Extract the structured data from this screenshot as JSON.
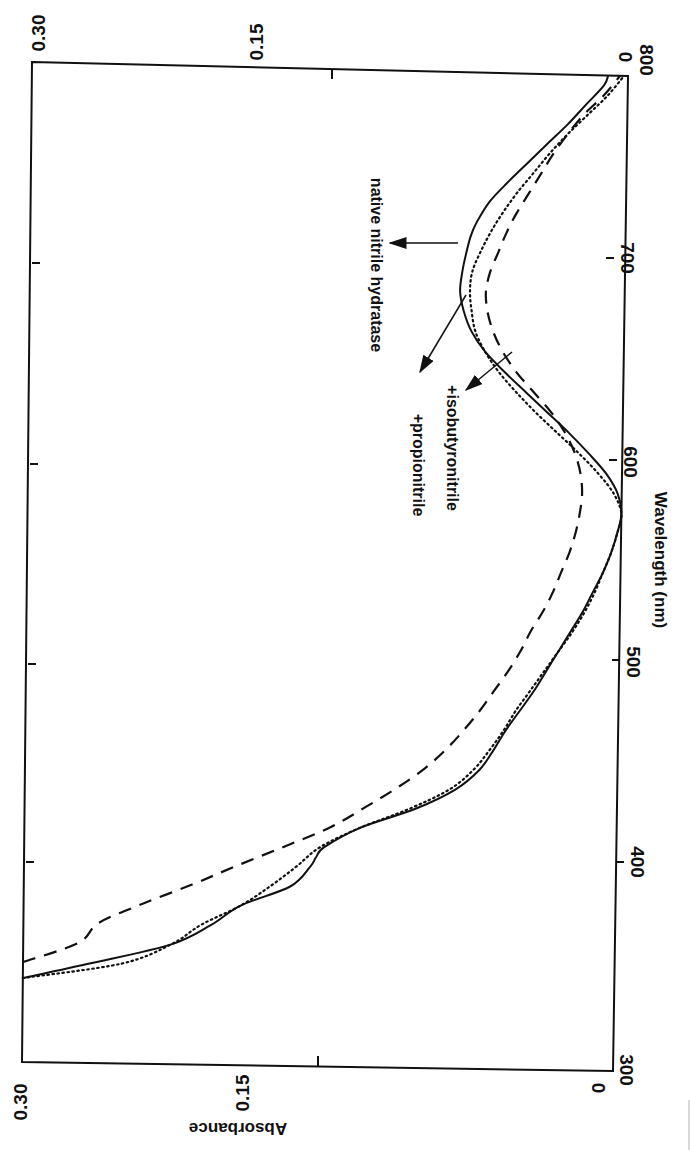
{
  "chart_data": {
    "type": "line",
    "title": "",
    "orientation": "rotated 90° clockwise (wavelength axis runs vertically on right, absorbance horizontally)",
    "xlabel": "Wavelength (nm)",
    "ylabel": "Absorbance",
    "xlim": [
      300,
      800
    ],
    "ylim": [
      0,
      0.3
    ],
    "x_ticks": [
      "300",
      "400",
      "500",
      "600",
      "700",
      "800"
    ],
    "y_ticks_bottom": [
      "0.30",
      "0.15",
      "0"
    ],
    "y_ticks_top": [
      "0.30",
      "0.15",
      "0"
    ],
    "grid": false,
    "legend": "inline annotations with arrows",
    "series": [
      {
        "name": "native nitrile hydratase",
        "style": "solid",
        "x": [
          342,
          350,
          360,
          370,
          380,
          390,
          400,
          405,
          410,
          420,
          430,
          440,
          450,
          460,
          470,
          480,
          490,
          500,
          510,
          520,
          530,
          540,
          550,
          560,
          570,
          580,
          590,
          600,
          610,
          620,
          630,
          640,
          650,
          660,
          670,
          680,
          690,
          700,
          710,
          718,
          725,
          735,
          745,
          755,
          765,
          775,
          785,
          795,
          800
        ],
        "values": [
          0.3,
          0.265,
          0.225,
          0.205,
          0.19,
          0.165,
          0.155,
          0.152,
          0.148,
          0.13,
          0.102,
          0.082,
          0.07,
          0.063,
          0.057,
          0.05,
          0.043,
          0.037,
          0.031,
          0.025,
          0.019,
          0.014,
          0.009,
          0.005,
          0.002,
          0.0,
          0.002,
          0.008,
          0.017,
          0.027,
          0.038,
          0.049,
          0.06,
          0.07,
          0.077,
          0.081,
          0.083,
          0.082,
          0.08,
          0.078,
          0.075,
          0.069,
          0.06,
          0.05,
          0.04,
          0.03,
          0.021,
          0.012,
          0.01
        ]
      },
      {
        "name": "+propionitrile",
        "style": "dotted",
        "x": [
          342,
          350,
          360,
          370,
          380,
          390,
          400,
          410,
          420,
          430,
          440,
          450,
          460,
          470,
          480,
          490,
          500,
          510,
          520,
          530,
          540,
          550,
          560,
          570,
          580,
          590,
          600,
          610,
          620,
          630,
          640,
          650,
          660,
          670,
          680,
          690,
          700,
          710,
          720,
          730,
          740,
          750,
          760,
          770,
          780,
          790,
          800
        ],
        "values": [
          0.3,
          0.25,
          0.225,
          0.21,
          0.19,
          0.175,
          0.162,
          0.15,
          0.13,
          0.105,
          0.085,
          0.073,
          0.065,
          0.058,
          0.052,
          0.045,
          0.038,
          0.031,
          0.024,
          0.018,
          0.013,
          0.009,
          0.005,
          0.002,
          0.0,
          0.004,
          0.012,
          0.022,
          0.033,
          0.044,
          0.054,
          0.063,
          0.07,
          0.075,
          0.077,
          0.078,
          0.077,
          0.073,
          0.068,
          0.062,
          0.055,
          0.047,
          0.039,
          0.03,
          0.02,
          0.01,
          0.002
        ]
      },
      {
        "name": "+isobutyronitrile",
        "style": "dashed",
        "x": [
          350,
          360,
          370,
          380,
          390,
          400,
          410,
          420,
          430,
          440,
          450,
          460,
          470,
          480,
          490,
          500,
          510,
          520,
          530,
          540,
          550,
          560,
          570,
          580,
          590,
          600,
          610,
          620,
          630,
          640,
          650,
          660,
          670,
          680,
          690,
          700,
          710,
          720,
          730,
          740,
          750,
          760,
          770,
          780,
          790,
          800
        ],
        "values": [
          0.3,
          0.272,
          0.262,
          0.24,
          0.215,
          0.192,
          0.168,
          0.145,
          0.128,
          0.112,
          0.098,
          0.087,
          0.078,
          0.07,
          0.063,
          0.056,
          0.05,
          0.045,
          0.039,
          0.034,
          0.03,
          0.026,
          0.023,
          0.021,
          0.02,
          0.021,
          0.024,
          0.029,
          0.036,
          0.045,
          0.054,
          0.061,
          0.066,
          0.069,
          0.07,
          0.068,
          0.064,
          0.06,
          0.055,
          0.049,
          0.043,
          0.037,
          0.03,
          0.022,
          0.012,
          0.004
        ]
      }
    ],
    "annotations": [
      {
        "text": "native nitrile hydratase",
        "target_series": "native nitrile hydratase"
      },
      {
        "text": "+propionitrile",
        "target_series": "+propionitrile"
      },
      {
        "text": "+isobutyronitrile",
        "target_series": "+isobutyronitrile"
      }
    ]
  },
  "labels": {
    "xlabel": "Wavelength (nm)",
    "ylabel": "Absorbance",
    "annot_native": "native nitrile hydratase",
    "annot_propio": "+propionitrile",
    "annot_isobut": "+isobutyronitrile",
    "x_tick_300": "300",
    "x_tick_400": "400",
    "x_tick_500": "500",
    "x_tick_600": "600",
    "x_tick_700": "700",
    "x_tick_800": "800",
    "y_bottom_030": "0.30",
    "y_bottom_015": "0.15",
    "y_bottom_0": "0",
    "y_top_030": "0.30",
    "y_top_015": "0.15",
    "y_top_0": "0"
  },
  "colors": {
    "ink": "#111111",
    "background": "#ffffff"
  }
}
